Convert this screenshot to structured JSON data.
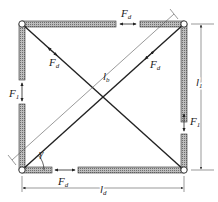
{
  "diagram": {
    "type": "braced-frame-force-diagram",
    "nodes": {
      "top_left": [
        22,
        24
      ],
      "top_right": [
        184,
        24
      ],
      "bottom_left": [
        22,
        170
      ],
      "bottom_right": [
        184,
        170
      ]
    },
    "members": {
      "top": {
        "force_label": "F",
        "force_sub": "d"
      },
      "bottom": {
        "force_label": "F",
        "force_sub": "d"
      },
      "left": {
        "force_label": "F",
        "force_sub": "1"
      },
      "right": {
        "force_label": "F",
        "force_sub": "1"
      },
      "diagonal_tl_br": {
        "force_label": "F",
        "force_sub": "d"
      },
      "diagonal_bl_tr": {
        "force_label": "F",
        "force_sub": "d"
      }
    },
    "dimensions": {
      "width": {
        "label": "l",
        "sub": "d"
      },
      "height": {
        "label": "l",
        "sub": "1"
      },
      "diagonal": {
        "label": "l",
        "sub": "b"
      }
    },
    "angle": {
      "label": "γ"
    },
    "colors": {
      "member_fill": "#9a9a9a",
      "member_edge": "#333333",
      "line": "#222222",
      "dim_line": "#555555"
    }
  }
}
